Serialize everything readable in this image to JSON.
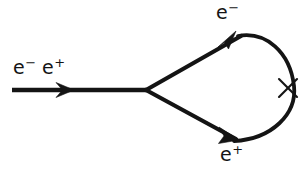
{
  "diagram": {
    "background_color": "#ffffff",
    "line_color": "#141414",
    "labels": {
      "incoming_base": "e",
      "incoming_sup_1": "−",
      "incoming_sup_2": "+",
      "incoming_second_base": "e",
      "incoming_full": "e− e+",
      "electron_base": "e",
      "electron_sup": "−",
      "electron_full": "e−",
      "positron_base": "e",
      "positron_sup": "+",
      "positron_full": "e+"
    },
    "elements": {
      "incoming_line_name": "incoming-fermion-line",
      "incoming_arrow_name": "incoming-arrow",
      "vertex_name": "annihilation-vertex",
      "upper_branch_name": "electron-branch",
      "lower_branch_name": "positron-branch",
      "loop_arc_name": "loop-arc",
      "cross_name": "mass-insertion-cross"
    },
    "geometry": {
      "incoming_start_x": 12,
      "incoming_end_x": 146,
      "incoming_y": 90,
      "vertex_x": 146,
      "vertex_y": 90,
      "loop_top_y": 33,
      "loop_bottom_y": 144,
      "loop_right_x": 295,
      "cross_x": 288,
      "cross_y": 88,
      "stroke_width": 4
    }
  }
}
